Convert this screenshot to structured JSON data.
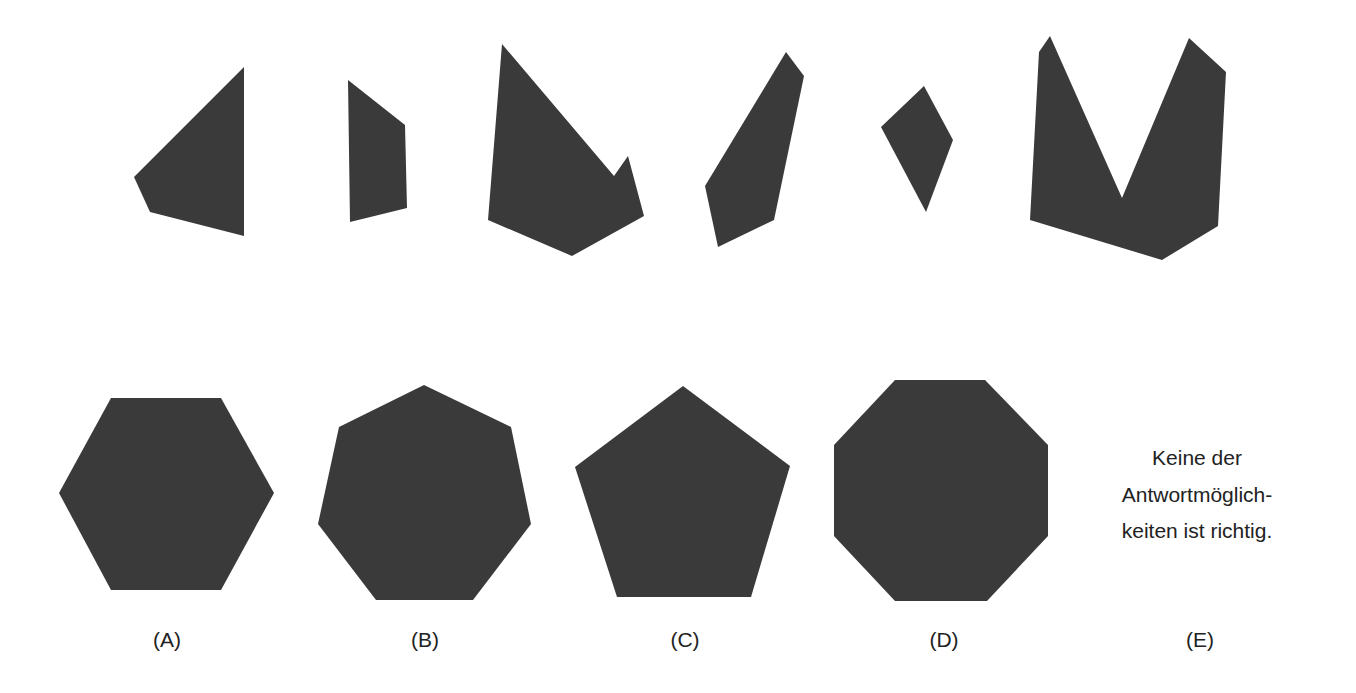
{
  "colors": {
    "shape_fill": "#3a3a3a",
    "text": "#222222",
    "background": "#ffffff"
  },
  "pieces": [
    {
      "id": "piece-1",
      "points": "244,67 244,236 150,212 134,177"
    },
    {
      "id": "piece-2",
      "points": "348,80 405,125 407,208 350,222"
    },
    {
      "id": "piece-3",
      "points": "502,44 614,176 628,156 644,216 572,256 488,220"
    },
    {
      "id": "piece-4",
      "points": "786,52 804,76 774,220 718,247 705,186"
    },
    {
      "id": "piece-5",
      "points": "924,86 953,140 926,212 881,127"
    },
    {
      "id": "piece-6",
      "points": "1050,36 1122,198 1189,38 1226,72 1218,226 1162,260 1030,220 1039,52"
    }
  ],
  "options": [
    {
      "label": "(A)",
      "shape": "hexagon",
      "points": "111,398 221,398 274,493 221,590 111,590 59,493",
      "label_x": 167
    },
    {
      "label": "(B)",
      "shape": "heptagon",
      "points": "424,385 511,427 531,524 473,600 376,600 318,524 339,427",
      "label_x": 425
    },
    {
      "label": "(C)",
      "shape": "pentagon",
      "points": "683,386 790,466 751,597 617,597 575,467",
      "label_x": 685
    },
    {
      "label": "(D)",
      "shape": "octagon",
      "points": "895,380 985,380 1048,445 1048,536 987,601 895,601 834,536 834,445",
      "label_x": 944
    },
    {
      "label": "(E)",
      "shape": "none",
      "text_lines": [
        "Keine der",
        "Antwortmöglich-",
        "keiten ist richtig."
      ],
      "label_x": 1200
    }
  ]
}
